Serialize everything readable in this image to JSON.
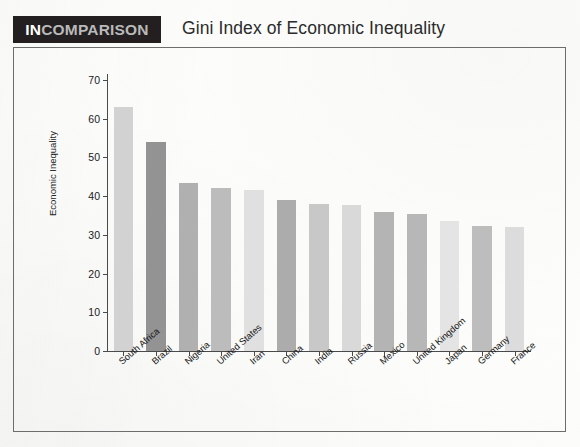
{
  "brand": {
    "prefix": "IN",
    "suffix": "COMPARISON"
  },
  "header": {
    "title": "Gini Index of Economic Inequality"
  },
  "colors": {
    "badge_background": "#231f20",
    "badge_prefix_text": "#ffffff",
    "badge_suffix_text": "#b9b9b9",
    "title_text": "#2b2b2b",
    "axis_line": "#4a4a4a",
    "frame_border": "#6d6d6d",
    "page_background": "#fdfdfc"
  },
  "chart_data": {
    "type": "bar",
    "title": "Gini Index of Economic Inequality",
    "xlabel": "",
    "ylabel": "Economic Inequality",
    "ylim": [
      0,
      70
    ],
    "yticks": [
      0,
      10,
      20,
      30,
      40,
      50,
      60,
      70
    ],
    "grid": false,
    "legend": "none",
    "categories": [
      "South Africa",
      "Brazil",
      "Nigeria",
      "United States",
      "Iran",
      "China",
      "India",
      "Russia",
      "Mexico",
      "United Kingdom",
      "Japan",
      "Germany",
      "France"
    ],
    "values": [
      63,
      54,
      43.5,
      42,
      41.5,
      39,
      38,
      37.8,
      36,
      35.5,
      33.5,
      32.2,
      32
    ],
    "bar_colors": [
      "#d2d2d2",
      "#939393",
      "#b0b0b0",
      "#bcbcbc",
      "#e0e0e0",
      "#acacac",
      "#c8c8c8",
      "#d9d9d9",
      "#b4b4b4",
      "#b7b7b7",
      "#e4e4e4",
      "#bdbdbd",
      "#dcdcdc"
    ]
  }
}
